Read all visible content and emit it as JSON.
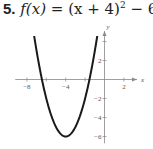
{
  "problem": {
    "number": "5.",
    "equation_lhs": "f(x)",
    "equation_rhs_base": "(x + 4)",
    "equation_exponent": "2",
    "equation_rhs_tail": "− 6"
  },
  "chart_data": {
    "type": "line",
    "xlabel": "x",
    "ylabel": "y",
    "xlim": [
      -9,
      3.5
    ],
    "ylim": [
      -6.5,
      5
    ],
    "x_ticks": [
      -8,
      -6,
      -4,
      -2,
      2
    ],
    "x_tick_labels": [
      "-8",
      "-4",
      "2"
    ],
    "y_ticks": [
      -6,
      -4,
      -2,
      2,
      4
    ],
    "y_tick_labels": [
      "-6",
      "-4",
      "-2",
      "2"
    ],
    "grid": false,
    "series": [
      {
        "name": "f(x) = (x + 4)^2 − 6",
        "function": "(x+4)^2-6",
        "vertex": [
          -4,
          -6
        ],
        "x": [
          -8.3,
          -8,
          -7,
          -6,
          -5,
          -4,
          -3,
          -2,
          -1,
          0,
          0.3
        ],
        "y": [
          12.49,
          10,
          3,
          -2,
          -5,
          -6,
          -5,
          -2,
          3,
          10,
          12.49
        ]
      }
    ],
    "colors": {
      "curve": "#1a1a1a",
      "axis": "#888888"
    }
  }
}
